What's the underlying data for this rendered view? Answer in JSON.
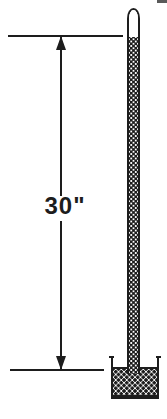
{
  "figure": {
    "dimension_label": "30\"",
    "colors": {
      "ink": "#1d1d1d",
      "background": "#ffffff"
    },
    "elements": {
      "tube": "closed glass tube with mercury column",
      "vacuum": "empty space at closed top of tube",
      "reservoir": "open cup of mercury at base",
      "dimension": "vertical double-headed arrow between mercury surface in cup and mercury top in tube"
    }
  }
}
